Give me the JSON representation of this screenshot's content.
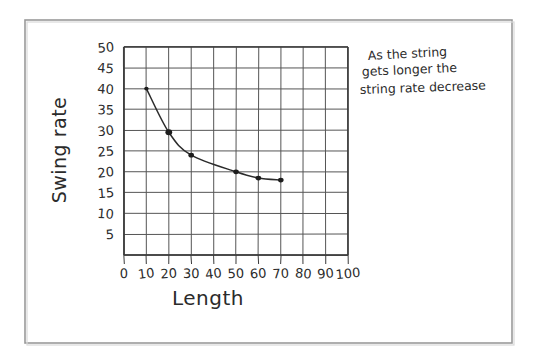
{
  "image": {
    "kind": "photograph-of-handwritten-worksheet",
    "background_color": "#ffffff",
    "ink_color": "#2b2b2b",
    "frame_color": "#9a9a9a",
    "grid_color": "#555555"
  },
  "frame": {
    "name": "page-border"
  },
  "annotation": {
    "line1": "As the string",
    "line2": "gets longer the",
    "line3": "string rate decrease",
    "full_text": "As the string gets longer the string rate decrease"
  },
  "chart_data": {
    "type": "line",
    "title": "",
    "xlabel": "Length",
    "ylabel": "Swing rate",
    "xlim": [
      0,
      100
    ],
    "ylim": [
      0,
      50
    ],
    "grid": true,
    "legend": "none",
    "xticks": [
      0,
      10,
      20,
      30,
      40,
      50,
      60,
      70,
      80,
      90,
      100
    ],
    "xtick_labels": [
      "0",
      "10",
      "20",
      "30",
      "40",
      "50",
      "60",
      "70",
      "80",
      "90",
      "100"
    ],
    "yticks": [
      5,
      10,
      15,
      20,
      25,
      30,
      35,
      40,
      45,
      50
    ],
    "ytick_labels": [
      "5",
      "10",
      "15",
      "20",
      "25",
      "30",
      "35",
      "40",
      "45",
      "50"
    ],
    "x": [
      10,
      20,
      30,
      50,
      60,
      70
    ],
    "values": [
      40,
      29.5,
      24,
      20,
      18.5,
      18
    ],
    "series": [
      {
        "name": "swing rate vs length",
        "x": [
          10,
          20,
          30,
          50,
          60,
          70
        ],
        "values": [
          40,
          29.5,
          24,
          20,
          18.5,
          18
        ],
        "marker": "filled-dot",
        "line": "hand-drawn-smooth-curve"
      }
    ]
  }
}
